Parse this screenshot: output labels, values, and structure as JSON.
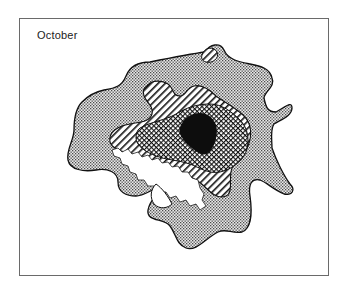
{
  "figure": {
    "title": "October",
    "zones": [
      {
        "name": "outer-zone",
        "fill": "stipple-dots"
      },
      {
        "name": "inner-ring-zone",
        "fill": "diagonal-hatch"
      },
      {
        "name": "core-ring-zone",
        "fill": "crosshatch"
      },
      {
        "name": "center-zone",
        "fill": "solid-black"
      },
      {
        "name": "coastal-inlet",
        "fill": "white"
      }
    ],
    "colors": {
      "frame": "#6a6a6a",
      "ink": "#111111",
      "background": "#ffffff"
    }
  }
}
